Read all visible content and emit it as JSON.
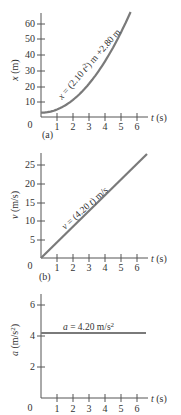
{
  "chart_data": [
    {
      "type": "line",
      "panel": "(a)",
      "title": "",
      "xlabel": "t (s)",
      "ylabel": "x (m)",
      "x_ticks": [
        "1",
        "2",
        "3",
        "4",
        "5",
        "6"
      ],
      "y_ticks": [
        "10",
        "20",
        "30",
        "40",
        "50",
        "60"
      ],
      "origin_label": "0",
      "xlim": [
        0,
        6.6
      ],
      "ylim": [
        0,
        68
      ],
      "grid": false,
      "annotation": "x = (2.10 t²) m +2.80 m",
      "series": [
        {
          "name": "x(t)",
          "x": [
            0,
            1,
            2,
            3,
            4,
            5,
            5.6
          ],
          "values": [
            2.8,
            4.9,
            11.2,
            21.7,
            36.4,
            55.3,
            68.7
          ]
        }
      ]
    },
    {
      "type": "line",
      "panel": "(b)",
      "title": "",
      "xlabel": "t (s)",
      "ylabel": "v (m/s)",
      "x_ticks": [
        "1",
        "2",
        "3",
        "4",
        "5",
        "6"
      ],
      "y_ticks": [
        "5",
        "10",
        "15",
        "20",
        "25"
      ],
      "origin_label": "0",
      "xlim": [
        0,
        6.6
      ],
      "ylim": [
        0,
        28
      ],
      "grid": false,
      "annotation": "v = (4.20 t) m/s",
      "series": [
        {
          "name": "v(t)",
          "x": [
            0,
            1,
            2,
            3,
            4,
            5,
            6,
            6.6
          ],
          "values": [
            0,
            4.2,
            8.4,
            12.6,
            16.8,
            21.0,
            25.2,
            27.7
          ]
        }
      ]
    },
    {
      "type": "line",
      "panel": "",
      "title": "",
      "xlabel": "t (s)",
      "ylabel": "a (m/s²)",
      "x_ticks": [
        "1",
        "2",
        "3",
        "4",
        "5",
        "6"
      ],
      "y_ticks": [
        "2",
        "4",
        "6"
      ],
      "origin_label": "0",
      "xlim": [
        0,
        6.6
      ],
      "ylim": [
        0,
        6.5
      ],
      "grid": false,
      "annotation": "a = 4.20 m/s²",
      "series": [
        {
          "name": "a(t)",
          "x": [
            0,
            6.5
          ],
          "values": [
            4.2,
            4.2
          ]
        }
      ]
    }
  ],
  "labels": {
    "a": {
      "ylabel_var": "x",
      "ylabel_unit": " (m)",
      "xlabel_var": "t",
      "xlabel_unit": " (s)",
      "panel": "(a)",
      "origin": "0",
      "eq_var": "x",
      "eq_rest1": " = (2.10 ",
      "eq_t": "t",
      "eq_sup": "2",
      "eq_rest2": ") m +2.80 m",
      "yticks": [
        "10",
        "20",
        "30",
        "40",
        "50",
        "60"
      ],
      "xticks": [
        "1",
        "2",
        "3",
        "4",
        "5",
        "6"
      ]
    },
    "b": {
      "ylabel_var": "v",
      "ylabel_unit": " (m/s)",
      "xlabel_var": "t",
      "xlabel_unit": " (s)",
      "panel": "(b)",
      "origin": "0",
      "eq_var": "v",
      "eq_rest1": " = (4.20 ",
      "eq_t": "t",
      "eq_rest2": ") m/s",
      "yticks": [
        "5",
        "10",
        "15",
        "20",
        "25"
      ],
      "xticks": [
        "1",
        "2",
        "3",
        "4",
        "5",
        "6"
      ]
    },
    "c": {
      "ylabel_var": "a",
      "ylabel_unit": " (m/s",
      "ylabel_sup": "2",
      "ylabel_close": ")",
      "xlabel_var": "t",
      "xlabel_unit": " (s)",
      "origin": "0",
      "eq_var": "a",
      "eq_rest": " = 4.20 m/s",
      "eq_sup": "2",
      "yticks": [
        "2",
        "4",
        "6"
      ],
      "xticks": [
        "1",
        "2",
        "3",
        "4",
        "5",
        "6"
      ]
    }
  },
  "colors": {
    "curve": "#7a7a7a",
    "axis": "#555555",
    "text": "#333333"
  }
}
